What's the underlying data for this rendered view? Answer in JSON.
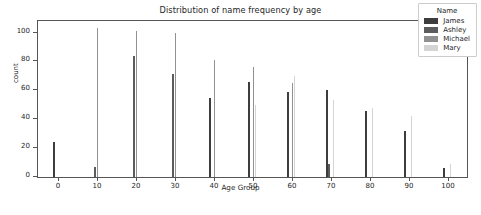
{
  "chart_data": {
    "type": "bar",
    "title": "Distribution of name frequency by age",
    "xlabel": "Age Group",
    "ylabel": "count",
    "categories": [
      "0",
      "10",
      "20",
      "30",
      "40",
      "50",
      "60",
      "70",
      "80",
      "90",
      "100"
    ],
    "xticks": [
      "0",
      "10",
      "20",
      "30",
      "40",
      "50",
      "60",
      "70",
      "80",
      "90",
      "100"
    ],
    "yticks": [
      "0",
      "20",
      "40",
      "60",
      "80",
      "100"
    ],
    "ylim": [
      0,
      108
    ],
    "xlim": [
      -5,
      105
    ],
    "grid": false,
    "legend_title": "Name",
    "legend_position": "upper right",
    "series": [
      {
        "name": "James",
        "color": "#3d3d3d",
        "values": [
          24,
          0,
          0,
          0,
          55,
          66,
          59,
          60,
          46,
          32,
          6
        ]
      },
      {
        "name": "Ashley",
        "color": "#5c5c5c",
        "values": [
          0,
          7,
          84,
          71,
          0,
          0,
          0,
          9,
          0,
          0,
          0
        ]
      },
      {
        "name": "Michael",
        "color": "#919191",
        "values": [
          0,
          103,
          101,
          100,
          81,
          76,
          65,
          0,
          0,
          0,
          0
        ]
      },
      {
        "name": "Mary",
        "color": "#d4d4d4",
        "values": [
          0,
          0,
          0,
          0,
          0,
          50,
          70,
          53,
          48,
          42,
          9
        ]
      }
    ]
  }
}
